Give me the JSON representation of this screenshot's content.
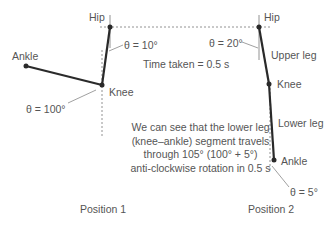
{
  "diagram": {
    "position1": {
      "title": "Position 1",
      "hip_label": "Hip",
      "knee_label": "Knee",
      "ankle_label": "Ankle",
      "upper_angle": "θ = 10°",
      "knee_angle": "θ = 100°"
    },
    "position2": {
      "title": "Position 2",
      "hip_label": "Hip",
      "knee_label": "Knee",
      "ankle_label": "Ankle",
      "upper_leg_label": "Upper leg",
      "lower_leg_label": "Lower leg",
      "upper_angle": "θ = 20°",
      "ankle_angle": "θ = 5°"
    },
    "time_taken": "Time taken = 0.5 s",
    "explanation": [
      "We can see that the lower leg",
      "(knee–ankle) segment travels",
      "through 105° (100° + 5°)",
      "anti-clockwise rotation in 0.5 s"
    ],
    "colors": {
      "segment": "#2a2a2a",
      "guide": "#666666",
      "text": "#555555"
    }
  }
}
